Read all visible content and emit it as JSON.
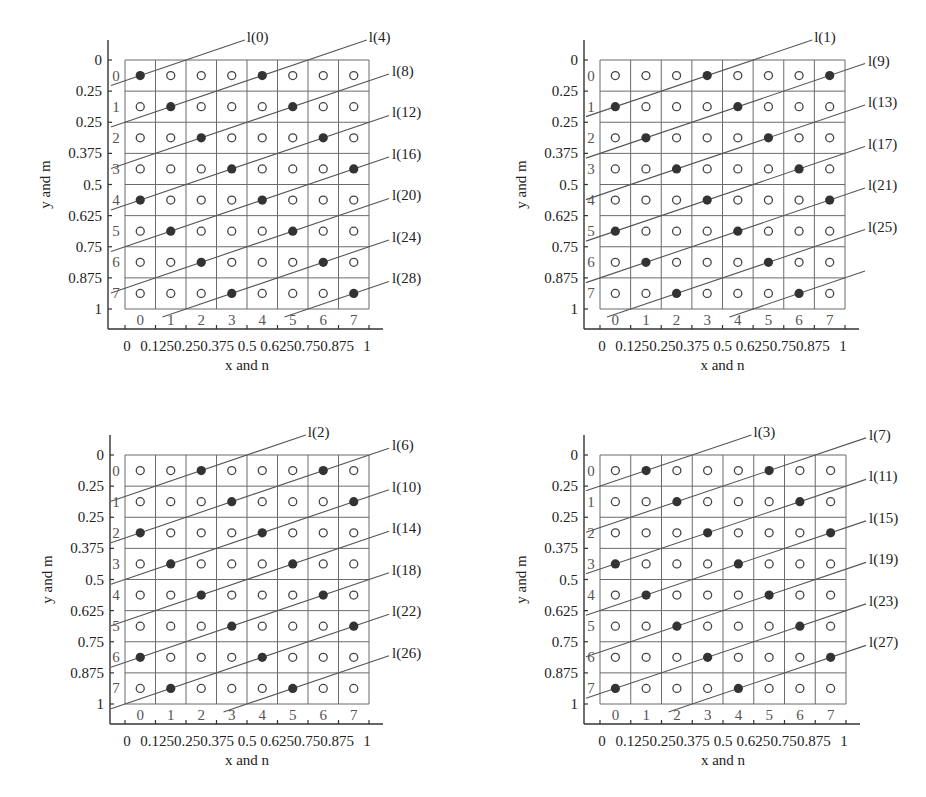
{
  "figure": {
    "grid_size": 8,
    "x_axis_title": "x and n",
    "y_axis_title": "y and m",
    "x_tick_labels": [
      "0",
      "0.125",
      "0.25",
      "0.375",
      "0.5",
      "0.625",
      "0.75",
      "0.875",
      "1"
    ],
    "y_tick_labels": [
      "0",
      "0.25",
      "0.25",
      "0.375",
      "0.5",
      "0.625",
      "0.75",
      "0.875",
      "1"
    ],
    "col_index_labels": [
      "0",
      "1",
      "2",
      "3",
      "4",
      "5",
      "6",
      "7"
    ],
    "row_index_labels": [
      "0",
      "1",
      "2",
      "3",
      "4",
      "5",
      "6",
      "7"
    ],
    "colors": {
      "grid": "#6b6b6b",
      "axis": "#333333",
      "filled_dot": "#333333",
      "open_dot": "#444444",
      "line": "#555555"
    }
  },
  "chart_data": [
    {
      "type": "scatter",
      "panel": "top-left",
      "offset": 0,
      "title": "",
      "xlabel": "x and n",
      "ylabel": "y and m",
      "filled_rule": "n mod 4 == (m + 0) mod 4",
      "filled_points": [
        [
          0,
          0
        ],
        [
          0,
          4
        ],
        [
          1,
          1
        ],
        [
          1,
          5
        ],
        [
          2,
          2
        ],
        [
          2,
          6
        ],
        [
          3,
          3
        ],
        [
          3,
          7
        ],
        [
          4,
          0
        ],
        [
          4,
          4
        ],
        [
          5,
          1
        ],
        [
          5,
          5
        ],
        [
          6,
          2
        ],
        [
          6,
          6
        ],
        [
          7,
          3
        ],
        [
          7,
          7
        ]
      ],
      "line_labels_top": [
        "l(0)",
        "l(4)"
      ],
      "line_labels_right": [
        "l(8)",
        "l(12)",
        "l(16)",
        "l(20)",
        "l(24)",
        "l(28)"
      ]
    },
    {
      "type": "scatter",
      "panel": "top-right",
      "offset": 1,
      "title": "",
      "xlabel": "x and n",
      "ylabel": "y and m",
      "filled_rule": "n mod 4 == (m + 1) mod 4",
      "filled_points": [
        [
          0,
          1
        ],
        [
          0,
          5
        ],
        [
          1,
          2
        ],
        [
          1,
          6
        ],
        [
          2,
          3
        ],
        [
          2,
          7
        ],
        [
          3,
          0
        ],
        [
          3,
          4
        ],
        [
          4,
          1
        ],
        [
          4,
          5
        ],
        [
          5,
          2
        ],
        [
          5,
          6
        ],
        [
          6,
          3
        ],
        [
          6,
          7
        ],
        [
          7,
          0
        ],
        [
          7,
          4
        ]
      ],
      "line_labels_top": [
        "l(1)",
        "l(5)"
      ],
      "line_labels_right": [
        "l(9)",
        "l(13)",
        "l(17)",
        "l(21)",
        "l(25)"
      ]
    },
    {
      "type": "scatter",
      "panel": "bottom-left",
      "offset": 2,
      "title": "",
      "xlabel": "x and n",
      "ylabel": "y and m",
      "filled_rule": "n mod 4 == (m + 2) mod 4",
      "filled_points": [
        [
          0,
          2
        ],
        [
          0,
          6
        ],
        [
          1,
          3
        ],
        [
          1,
          7
        ],
        [
          2,
          0
        ],
        [
          2,
          4
        ],
        [
          3,
          1
        ],
        [
          3,
          5
        ],
        [
          4,
          2
        ],
        [
          4,
          6
        ],
        [
          5,
          3
        ],
        [
          5,
          7
        ],
        [
          6,
          0
        ],
        [
          6,
          4
        ],
        [
          7,
          1
        ],
        [
          7,
          5
        ]
      ],
      "line_labels_top": [
        "l(2)"
      ],
      "line_labels_right": [
        "l(6)",
        "l(10)",
        "l(14)",
        "l(18)",
        "l(22)",
        "l(26)"
      ]
    },
    {
      "type": "scatter",
      "panel": "bottom-right",
      "offset": 3,
      "title": "",
      "xlabel": "x and n",
      "ylabel": "y and m",
      "filled_rule": "n mod 4 == (m + 3) mod 4",
      "filled_points": [
        [
          0,
          3
        ],
        [
          0,
          7
        ],
        [
          1,
          0
        ],
        [
          1,
          4
        ],
        [
          2,
          1
        ],
        [
          2,
          5
        ],
        [
          3,
          2
        ],
        [
          3,
          6
        ],
        [
          4,
          3
        ],
        [
          4,
          7
        ],
        [
          5,
          0
        ],
        [
          5,
          4
        ],
        [
          6,
          1
        ],
        [
          6,
          5
        ],
        [
          7,
          2
        ],
        [
          7,
          6
        ]
      ],
      "line_labels_top": [
        "l(3)"
      ],
      "line_labels_right": [
        "l(7)",
        "l(11)",
        "l(15)",
        "l(19)",
        "l(23)",
        "l(27)"
      ]
    }
  ]
}
